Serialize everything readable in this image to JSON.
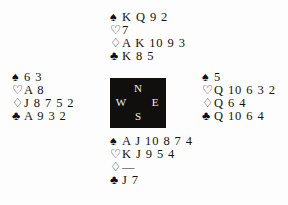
{
  "diagram": {
    "type": "bridge-deal",
    "compass": {
      "north_label": "N",
      "west_label": "W",
      "east_label": "E",
      "south_label": "S",
      "background_color": "#110f0e",
      "text_color": "#f2f0ec"
    },
    "suit_symbols": {
      "spade": "♠",
      "heart": "♡",
      "diamond": "♢",
      "club": "♣"
    },
    "void_marker": "—",
    "hands": {
      "north": {
        "position_label": "North",
        "spades": "K Q 9 2",
        "hearts": "7",
        "diamonds": "A K 10 9 3",
        "clubs": "K 8 5"
      },
      "west": {
        "position_label": "West",
        "spades": "6 3",
        "hearts": "A 8",
        "diamonds": "J 8 7 5 2",
        "clubs": "A 9 3 2"
      },
      "east": {
        "position_label": "East",
        "spades": "5",
        "hearts": "Q 10 6 3 2",
        "diamonds": "Q 6 4",
        "clubs": "Q 10 6 4"
      },
      "south": {
        "position_label": "South",
        "spades": "A J 10 8 7 4",
        "hearts": "K J 9 5 4",
        "diamonds": "—",
        "clubs": "J 7"
      }
    }
  }
}
